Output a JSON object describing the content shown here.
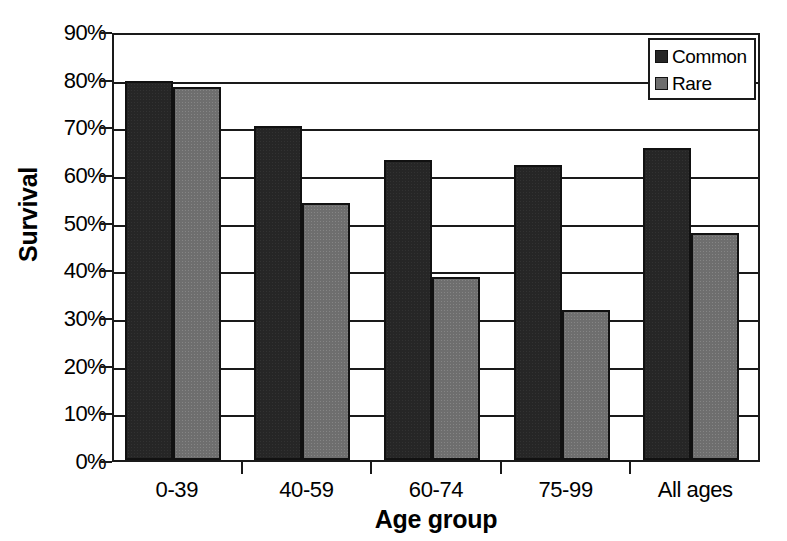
{
  "chart_data": {
    "type": "bar",
    "title": "",
    "xlabel": "Age group",
    "ylabel": "Survival",
    "categories": [
      "0-39",
      "40-59",
      "60-74",
      "75-99",
      "All ages"
    ],
    "series": [
      {
        "name": "Common",
        "color": "#262626",
        "values": [
          79.5,
          70.0,
          63.0,
          61.8,
          65.5
        ]
      },
      {
        "name": "Rare",
        "color": "#6e6e6e",
        "values": [
          78.3,
          54.0,
          38.3,
          31.5,
          47.6
        ]
      }
    ],
    "ylim": [
      0,
      90
    ],
    "ytick_values": [
      0,
      10,
      20,
      30,
      40,
      50,
      60,
      70,
      80,
      90
    ],
    "ytick_labels": [
      "0%",
      "10%",
      "20%",
      "30%",
      "40%",
      "50%",
      "60%",
      "70%",
      "80%",
      "90%"
    ],
    "grid": true,
    "grid_axis": "y",
    "legend_position": "top-right",
    "legend_entries": [
      "Common",
      "Rare"
    ]
  },
  "axes": {
    "y_title": "Survival",
    "x_title": "Age group"
  },
  "legend": {
    "items": [
      {
        "label": "Common"
      },
      {
        "label": "Rare"
      }
    ]
  },
  "colors": {
    "common": "#262626",
    "rare": "#6e6e6e",
    "axis": "#1a1a1a",
    "background": "#ffffff"
  }
}
